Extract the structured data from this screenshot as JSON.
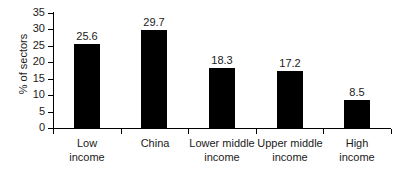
{
  "chart_data": {
    "type": "bar",
    "title": "",
    "subtitle": "",
    "xlabel": "",
    "ylabel": "% of sectors",
    "ylim": [
      0,
      35
    ],
    "yticks": [
      0,
      5,
      10,
      15,
      20,
      25,
      30,
      35
    ],
    "grid": false,
    "legend": null,
    "bar_color": "#000000",
    "categories": [
      "Low income",
      "China",
      "Lower middle income",
      "Upper middle income",
      "High income"
    ],
    "category_lines": [
      [
        "Low",
        "income"
      ],
      [
        "China",
        ""
      ],
      [
        "Lower middle",
        "income"
      ],
      [
        "Upper middle",
        "income"
      ],
      [
        "High",
        "income"
      ]
    ],
    "values": [
      25.6,
      29.7,
      18.3,
      17.2,
      8.5
    ],
    "value_labels": [
      "25.6",
      "29.7",
      "18.3",
      "17.2",
      "8.5"
    ]
  },
  "axis": {
    "y_tick_labels": [
      "35",
      "30",
      "25",
      "20",
      "15",
      "10",
      "5",
      "0"
    ]
  }
}
